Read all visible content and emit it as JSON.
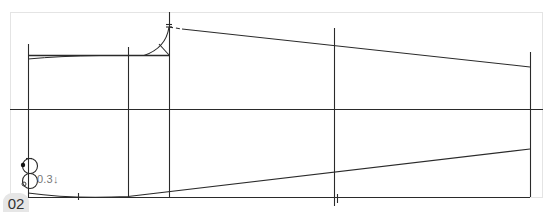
{
  "figure": {
    "label": "02",
    "measurement_note": "0.3",
    "arrow_glyph": "↓",
    "colors": {
      "line": "#2a2a2a",
      "frame": "#e4e4e4",
      "badge_bg": "#e6e6e6",
      "note_text": "#777777"
    }
  }
}
